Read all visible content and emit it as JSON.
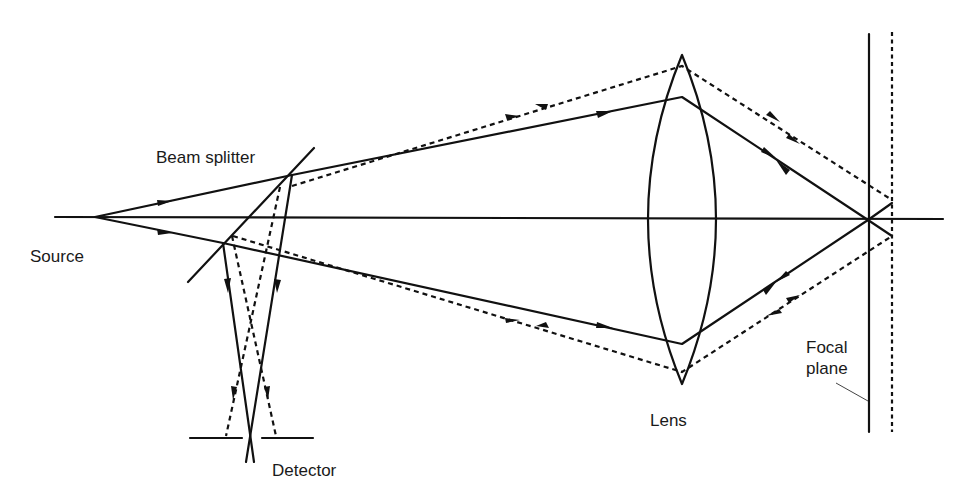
{
  "diagram": {
    "type": "optical-ray-diagram",
    "labels": {
      "source": "Source",
      "beam_splitter": "Beam splitter",
      "lens": "Lens",
      "detector": "Detector",
      "focal_plane_line1": "Focal",
      "focal_plane_line2": "plane"
    },
    "components": [
      {
        "name": "source",
        "position": [
          95,
          217
        ]
      },
      {
        "name": "beam-splitter",
        "from": [
          188,
          282
        ],
        "to": [
          314,
          148
        ]
      },
      {
        "name": "lens",
        "top": [
          682,
          55
        ],
        "bottom": [
          682,
          384
        ],
        "left_edge_x": 643,
        "right_edge_x": 720
      },
      {
        "name": "focal-plane",
        "x": 869,
        "y_range": [
          34,
          432
        ],
        "style": "solid"
      },
      {
        "name": "defocused-plane",
        "x": 892,
        "y_range": [
          32,
          432
        ],
        "style": "dotted"
      },
      {
        "name": "detector-left",
        "from": [
          190,
          438
        ],
        "to": [
          242,
          438
        ]
      },
      {
        "name": "detector-right",
        "from": [
          262,
          438
        ],
        "to": [
          313,
          438
        ]
      },
      {
        "name": "optical-axis",
        "from": [
          55,
          217
        ],
        "to": [
          943,
          219
        ]
      }
    ],
    "rays": {
      "solid_in_focus": "Rays from the source pass the beam splitter, are focused by the lens onto the focal plane, reflect back along the same path and are diverted by the beam splitter to cross at the detector aperture.",
      "dashed_out_of_focus": "Rays reflecting off a surface displaced from the focal plane return along a different path and are blocked by the detector pinhole."
    }
  }
}
